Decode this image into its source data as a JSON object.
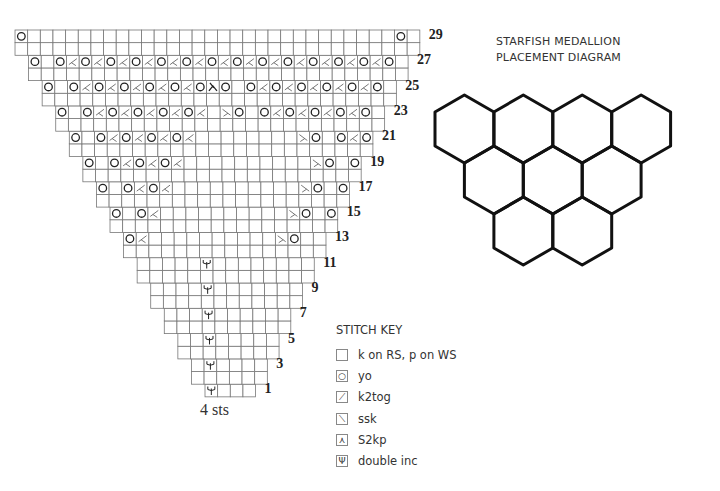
{
  "chart": {
    "cell": 12.65,
    "row1_left": 205,
    "left_step": 13.57,
    "top_y": 30,
    "bottom_label": "4 sts",
    "rs_rows": [
      {
        "row": 1,
        "stitches": "y..."
      },
      {
        "row": 3,
        "stitches": ".y...."
      },
      {
        "row": 5,
        "stitches": "..y....."
      },
      {
        "row": 7,
        "stitches": "...y......"
      },
      {
        "row": 9,
        "stitches": "....y......."
      },
      {
        "row": 11,
        "stitches": ".....y........"
      },
      {
        "row": 13,
        "stitches": "o/..........\\o.."
      },
      {
        "row": 15,
        "stitches": "o.o/..........\\o.o."
      },
      {
        "row": 17,
        "stitches": "o.o/o/..........\\o.o/o."
      },
      {
        "row": 19,
        "stitches": "o.o/o/o/..........\\o.o/o/o."
      },
      {
        "row": 21,
        "stitches": "o.o/o/o/o/........\\o.o/o/o/o."
      },
      {
        "row": 23,
        "stitches": "o.o/o/o/o/o/.\\o.o/o/o/o/o."
      },
      {
        "row": 25,
        "stitches": "o.o/o/o/o/o/o^o.o/o/o/o/o/o."
      },
      {
        "row": 27,
        "stitches": "o.o/o/o/o/o/o/o/o/o/o/o/o/o/o."
      },
      {
        "row": 29,
        "stitches": "o.............................o."
      }
    ]
  },
  "diagram": {
    "title_line1": "STARFISH MEDALLION",
    "title_line2": "PLACEMENT DIAGRAM",
    "hex_rows": [
      4,
      3,
      2
    ]
  },
  "key": {
    "title": "STITCH KEY",
    "items": [
      {
        "symbol": "",
        "label": "k on RS, p on WS",
        "icon": "empty-square-icon"
      },
      {
        "symbol": "○",
        "label": "yo",
        "icon": "yarn-over-icon"
      },
      {
        "symbol": "⟋",
        "label": "k2tog",
        "icon": "k2tog-icon"
      },
      {
        "symbol": "⟍",
        "label": "ssk",
        "icon": "ssk-icon"
      },
      {
        "symbol": "⋏",
        "label": "S2kp",
        "icon": "s2kp-icon"
      },
      {
        "symbol": "Ψ",
        "label": "double inc",
        "icon": "double-inc-icon"
      }
    ]
  }
}
